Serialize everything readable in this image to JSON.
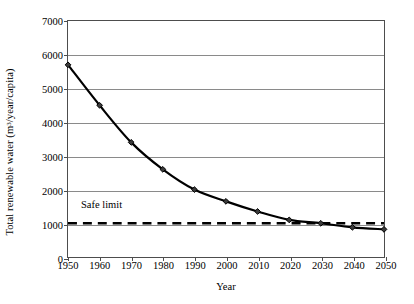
{
  "chart_data": {
    "type": "line",
    "title": "",
    "xlabel": "Year",
    "ylabel": "Total renewable water (m3/year/capita)",
    "ylabel_prefix": "Total renewable water (m",
    "ylabel_sup": "3",
    "ylabel_suffix": "/year/capita)",
    "x": [
      1950,
      1960,
      1970,
      1980,
      1990,
      2000,
      2010,
      2020,
      2030,
      2040,
      2050
    ],
    "values": [
      5700,
      4500,
      3400,
      2600,
      2000,
      1650,
      1350,
      1100,
      1000,
      880,
      820
    ],
    "series": [
      {
        "name": "Total renewable water per capita",
        "values": [
          5700,
          4500,
          3400,
          2600,
          2000,
          1650,
          1350,
          1100,
          1000,
          880,
          820
        ]
      }
    ],
    "xlim": [
      1950,
      2050
    ],
    "ylim": [
      0,
      7000
    ],
    "xticks": [
      1950,
      1960,
      1970,
      1980,
      1990,
      2000,
      2010,
      2020,
      2030,
      2040,
      2050
    ],
    "xtick_labels": [
      "1950",
      "1960",
      "1970",
      "1980",
      "1990",
      "2000",
      "2010",
      "2020",
      "2030",
      "2040",
      "2050"
    ],
    "yticks": [
      0,
      1000,
      2000,
      3000,
      4000,
      5000,
      6000,
      7000
    ],
    "ytick_labels": [
      "0",
      "1000",
      "2000",
      "3000",
      "4000",
      "5000",
      "6000",
      "7000"
    ],
    "grid": "horizontal",
    "legend": "none",
    "annotations": [
      {
        "name": "safe-limit",
        "label": "Safe limit",
        "value": 1000,
        "style": "dashed-horizontal-line"
      }
    ],
    "colors": {
      "line": "#000000",
      "marker": "#3a3a3a",
      "grid": "#8a8a8a",
      "frame": "#4d4d4d",
      "safe_limit": "#000000",
      "background": "#ffffff"
    }
  }
}
